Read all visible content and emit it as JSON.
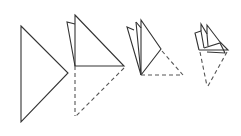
{
  "diagram": {
    "title": "",
    "colors": {
      "stroke": "#333333",
      "dashed": "#555555",
      "background": "#ffffff"
    },
    "steps": [
      {
        "id": 1,
        "label": "",
        "shape": "triangle"
      },
      {
        "id": 2,
        "label": "",
        "shape": "triangle-folded-once"
      },
      {
        "id": 3,
        "label": "",
        "shape": "triangle-folded-twice"
      },
      {
        "id": 4,
        "label": "",
        "shape": "triangle-folded-thrice"
      }
    ]
  }
}
